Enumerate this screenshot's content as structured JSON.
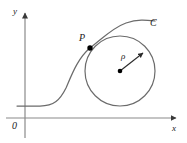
{
  "figure": {
    "kind": "osculating-circle-diagram",
    "width": 187,
    "height": 143,
    "background_color": "#ffffff",
    "stroke_color": "#6b6b6b",
    "axis_color": "#7a7a7a",
    "text_color": "#1a1a1a",
    "dot_color": "#000000"
  },
  "labels": {
    "y_axis": "y",
    "x_axis": "x",
    "origin": "0",
    "point_of_tangency": "P",
    "curve": "C",
    "radius": "ρ"
  },
  "geometry": {
    "x_axis": {
      "y": 118,
      "x_start": 6,
      "x_end": 180,
      "arrow": "right"
    },
    "y_axis": {
      "x": 25,
      "y_start": 138,
      "y_end": 9,
      "arrow": "up"
    },
    "circle": {
      "cx": 120,
      "cy": 71,
      "r": 35
    },
    "center_dot": {
      "cx": 120,
      "cy": 71,
      "r": 2.2
    },
    "tangent_point_dot": {
      "cx": 90,
      "cy": 48,
      "r": 2.6
    },
    "radius_arrow": {
      "x1": 120,
      "y1": 71,
      "x2": 146,
      "y2": 51
    },
    "curve_path": "M 17 106 L 40 106 C 54 106 60 100 66 88 C 72 74 78 58 90 48 C 102 39 112 28 126 23 C 138 19 146 20 155 21"
  }
}
